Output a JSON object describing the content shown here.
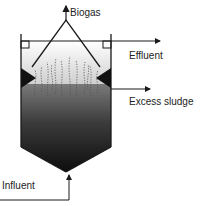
{
  "diagram": {
    "labels": {
      "biogas": "Biogas",
      "effluent": "Effluent",
      "excess_sludge": "Excess sludge",
      "influent": "Influent"
    },
    "colors": {
      "line": "#1a1a1a",
      "sludge_top": "#6e6e6e",
      "sludge_bottom": "#0f0f0f",
      "liquid_top": "#ffffff",
      "liquid_bottom": "#d4d4d4",
      "bubbles": "#555555"
    }
  }
}
